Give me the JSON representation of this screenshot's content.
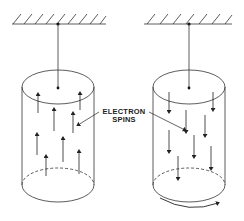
{
  "figure": {
    "label_line1": "ELECTRON",
    "label_line2": "SPINS",
    "left_cylinder": {
      "description": "suspended cylinder, electron spins aligned up",
      "spin_direction": "up",
      "spin_count": 8
    },
    "right_cylinder": {
      "description": "suspended cylinder, electron spins reversed (down), cylinder rotates",
      "spin_direction": "down",
      "spin_count": 8,
      "rotation_arrow": "clockwise-viewed-from-front"
    },
    "colors": {
      "line": "#222222",
      "background": "#ffffff"
    }
  }
}
